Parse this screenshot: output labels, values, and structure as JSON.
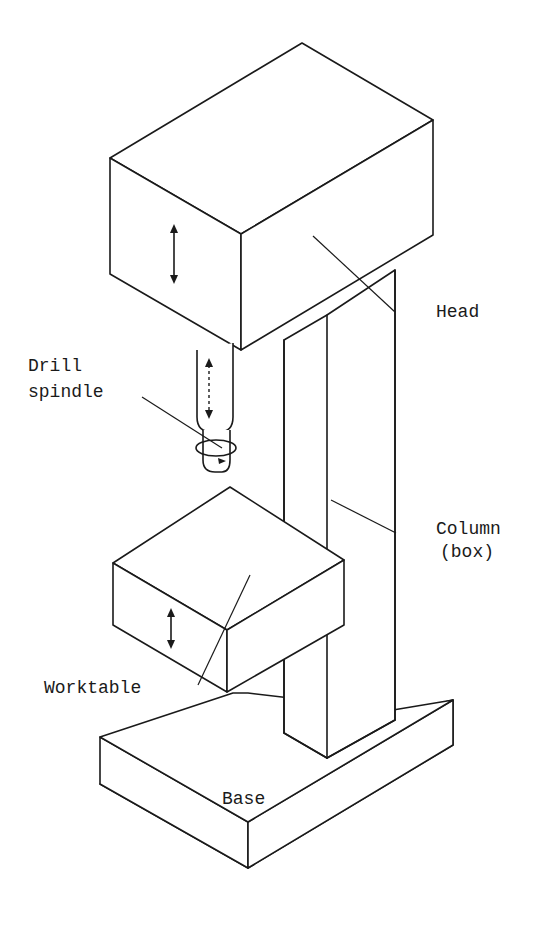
{
  "diagram": {
    "labels": {
      "head": "Head",
      "drill_spindle_line1": "Drill",
      "drill_spindle_line2": "spindle",
      "column_line1": "Column",
      "column_line2": "(box)",
      "worktable": "Worktable",
      "base": "Base"
    },
    "motion_indicators": [
      {
        "part": "head",
        "type": "vertical double arrow"
      },
      {
        "part": "drill_spindle",
        "type": "vertical dashed double arrow"
      },
      {
        "part": "drill_spindle",
        "type": "rotation arrow"
      },
      {
        "part": "worktable",
        "type": "vertical double arrow"
      }
    ],
    "colors": {
      "line": "#1a1a1a",
      "background": "#ffffff"
    }
  }
}
